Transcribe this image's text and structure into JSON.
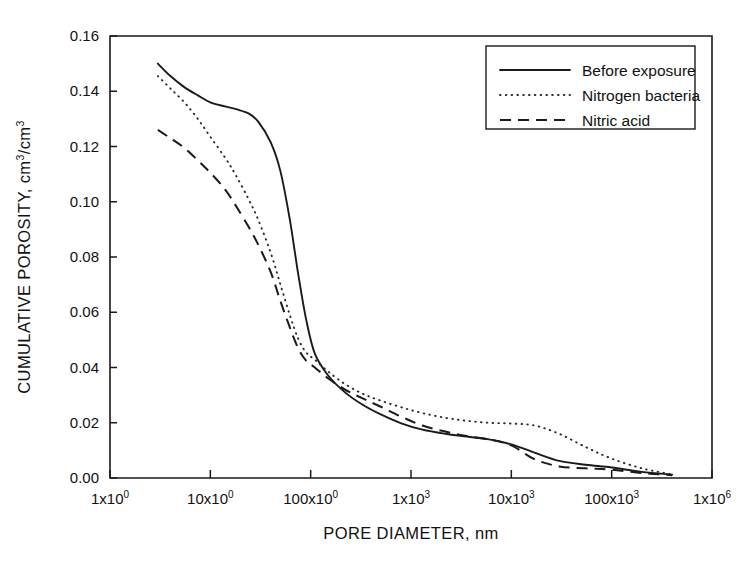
{
  "chart_data": {
    "type": "line",
    "title": "",
    "xlabel": "PORE DIAMETER, nm",
    "ylabel": "CUMULATIVE POROSITY, cm3/cm3",
    "ylabel_display": "CUMULATIVE POROSITY, cm",
    "ylabel_sup1": "3",
    "ylabel_mid": "/cm",
    "ylabel_sup2": "3",
    "xscale": "log",
    "yscale": "linear",
    "xlim": [
      1,
      1000000
    ],
    "ylim": [
      0.0,
      0.16
    ],
    "grid": false,
    "legend_position": "top-right",
    "y_ticks": [
      "0.00",
      "0.02",
      "0.04",
      "0.06",
      "0.08",
      "0.10",
      "0.12",
      "0.14",
      "0.16"
    ],
    "y_tick_values": [
      0.0,
      0.02,
      0.04,
      0.06,
      0.08,
      0.1,
      0.12,
      0.14,
      0.16
    ],
    "x_ticks": [
      {
        "mantissa": "1x10",
        "exponent": "0",
        "value": 1
      },
      {
        "mantissa": "10x10",
        "exponent": "0",
        "value": 10
      },
      {
        "mantissa": "100x10",
        "exponent": "0",
        "value": 100
      },
      {
        "mantissa": "1x10",
        "exponent": "3",
        "value": 1000
      },
      {
        "mantissa": "10x10",
        "exponent": "3",
        "value": 10000
      },
      {
        "mantissa": "100x10",
        "exponent": "3",
        "value": 100000
      },
      {
        "mantissa": "1x10",
        "exponent": "6",
        "value": 1000000
      }
    ],
    "series": [
      {
        "name": "Before exposure",
        "style": "solid",
        "color": "#1a1a1a",
        "x": [
          3.0,
          4.0,
          5.5,
          7.5,
          10.0,
          14.0,
          18.0,
          24.0,
          30.0,
          40.0,
          50.0,
          62.0,
          75.0,
          90.0,
          110.0,
          150.0,
          220.0,
          330.0,
          500.0,
          800.0,
          1300.0,
          2200.0,
          3600.0,
          6000.0,
          10000.0,
          17000.0,
          30000.0,
          55000.0,
          100000.0,
          200000.0,
          400000.0
        ],
        "y": [
          0.15,
          0.1455,
          0.1415,
          0.1385,
          0.136,
          0.1345,
          0.1335,
          0.132,
          0.129,
          0.1215,
          0.111,
          0.0935,
          0.074,
          0.0575,
          0.045,
          0.037,
          0.031,
          0.0265,
          0.023,
          0.0198,
          0.0175,
          0.016,
          0.015,
          0.014,
          0.0122,
          0.0092,
          0.0062,
          0.0048,
          0.0038,
          0.0022,
          0.0012
        ]
      },
      {
        "name": "Nitrogen bacteria",
        "style": "dotted",
        "color": "#2b2b2b",
        "x": [
          3.0,
          4.0,
          5.5,
          7.5,
          10.0,
          14.0,
          18.0,
          24.0,
          30.0,
          40.0,
          50.0,
          62.0,
          75.0,
          90.0,
          110.0,
          150.0,
          220.0,
          330.0,
          500.0,
          800.0,
          1300.0,
          2200.0,
          3600.0,
          6000.0,
          10000.0,
          17000.0,
          30000.0,
          55000.0,
          100000.0,
          200000.0,
          400000.0
        ],
        "y": [
          0.1455,
          0.141,
          0.136,
          0.13,
          0.1235,
          0.116,
          0.1095,
          0.101,
          0.0935,
          0.0815,
          0.07,
          0.059,
          0.0505,
          0.0455,
          0.0428,
          0.0385,
          0.034,
          0.0305,
          0.028,
          0.0256,
          0.0235,
          0.0218,
          0.0207,
          0.02,
          0.0197,
          0.019,
          0.016,
          0.0112,
          0.007,
          0.0035,
          0.0013
        ]
      },
      {
        "name": "Nitric acid",
        "style": "dashed",
        "color": "#1a1a1a",
        "x": [
          3.0,
          4.0,
          5.5,
          7.5,
          10.0,
          14.0,
          18.0,
          24.0,
          30.0,
          40.0,
          50.0,
          62.0,
          75.0,
          90.0,
          110.0,
          150.0,
          220.0,
          330.0,
          500.0,
          800.0,
          1300.0,
          2200.0,
          3600.0,
          6000.0,
          10000.0,
          17000.0,
          30000.0,
          55000.0,
          100000.0,
          200000.0,
          400000.0
        ],
        "y": [
          0.126,
          0.123,
          0.1195,
          0.115,
          0.1105,
          0.1045,
          0.0985,
          0.091,
          0.0845,
          0.0745,
          0.064,
          0.0545,
          0.047,
          0.0425,
          0.04,
          0.036,
          0.032,
          0.0288,
          0.0258,
          0.0222,
          0.019,
          0.0168,
          0.0152,
          0.014,
          0.0118,
          0.0068,
          0.0042,
          0.0035,
          0.003,
          0.0018,
          0.001
        ]
      }
    ]
  }
}
